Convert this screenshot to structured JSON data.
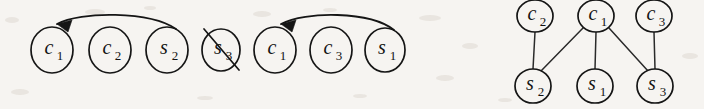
{
  "figure": {
    "background_color": "#f6f4f1",
    "ink_color": "#151515",
    "panels": [
      {
        "id": "sequence-panel",
        "name": "clause-variable-sequence",
        "description": "Linear sequence of labelled nodes with two backward arcs and one crossed-out node"
      },
      {
        "id": "graph-panel",
        "name": "bipartite-incidence-graph",
        "description": "Two-row bipartite graph of clause nodes over variable nodes"
      }
    ]
  },
  "sequence": {
    "nodes": [
      {
        "key": "seq-0",
        "base": "c",
        "sub": "1",
        "label": "c1",
        "cx": 52,
        "cy": 50,
        "rx": 21,
        "ry": 23,
        "crossed": false
      },
      {
        "key": "seq-1",
        "base": "c",
        "sub": "2",
        "label": "c2",
        "cx": 110,
        "cy": 50,
        "rx": 21,
        "ry": 23,
        "crossed": false
      },
      {
        "key": "seq-2",
        "base": "s",
        "sub": "2",
        "label": "s2",
        "cx": 167,
        "cy": 50,
        "rx": 21,
        "ry": 23,
        "crossed": false
      },
      {
        "key": "seq-3",
        "base": "s",
        "sub": "3",
        "label": "s3",
        "cx": 221,
        "cy": 50,
        "rx": 19,
        "ry": 21,
        "crossed": true
      },
      {
        "key": "seq-4",
        "base": "c",
        "sub": "1",
        "label": "c1",
        "cx": 275,
        "cy": 50,
        "rx": 21,
        "ry": 23,
        "crossed": false
      },
      {
        "key": "seq-5",
        "base": "c",
        "sub": "3",
        "label": "c3",
        "cx": 331,
        "cy": 50,
        "rx": 21,
        "ry": 23,
        "crossed": false
      },
      {
        "key": "seq-6",
        "base": "s",
        "sub": "1",
        "label": "s1",
        "cx": 385,
        "cy": 50,
        "rx": 20,
        "ry": 22,
        "crossed": false
      }
    ],
    "strike": {
      "x1": 204,
      "y1": 29,
      "x2": 239,
      "y2": 70
    },
    "arcs": [
      {
        "key": "arc-0",
        "name": "backward-arc-s2-to-c1",
        "from": "seq-2",
        "to": "seq-0",
        "path": "M 176 29 C 150 11, 80 11, 57 24",
        "head": "57,24 72,20 68,32",
        "head_rotation": -28
      },
      {
        "key": "arc-1",
        "name": "backward-arc-s1-to-c1",
        "from": "seq-6",
        "to": "seq-4",
        "path": "M 394 30 C 370 11, 305 11, 281 24",
        "head": "281,24 296,20 292,32",
        "head_rotation": -28
      }
    ]
  },
  "graph": {
    "top_nodes": [
      {
        "key": "g-c2",
        "base": "c",
        "sub": "2",
        "label": "c2",
        "cx": 535,
        "cy": 16,
        "rx": 18,
        "ry": 16
      },
      {
        "key": "g-c1",
        "base": "c",
        "sub": "1",
        "label": "c1",
        "cx": 596,
        "cy": 16,
        "rx": 18,
        "ry": 16
      },
      {
        "key": "g-c3",
        "base": "c",
        "sub": "3",
        "label": "c3",
        "cx": 654,
        "cy": 16,
        "rx": 18,
        "ry": 16
      }
    ],
    "bottom_nodes": [
      {
        "key": "g-s2",
        "base": "s",
        "sub": "2",
        "label": "s2",
        "cx": 533,
        "cy": 86,
        "rx": 18,
        "ry": 17
      },
      {
        "key": "g-s1",
        "base": "s",
        "sub": "1",
        "label": "s1",
        "cx": 595,
        "cy": 86,
        "rx": 18,
        "ry": 17
      },
      {
        "key": "g-s3",
        "base": "s",
        "sub": "3",
        "label": "s3",
        "cx": 655,
        "cy": 86,
        "rx": 18,
        "ry": 17
      }
    ],
    "edges": [
      {
        "key": "e-c2-s2",
        "name": "edge-c2-s2",
        "from": "g-c2",
        "to": "g-s2",
        "x1": 535,
        "y1": 32,
        "x2": 533,
        "y2": 69
      },
      {
        "key": "e-c1-s2",
        "name": "edge-c1-s2",
        "from": "g-c1",
        "to": "g-s2",
        "x1": 583,
        "y1": 28,
        "x2": 541,
        "y2": 71
      },
      {
        "key": "e-c1-s1",
        "name": "edge-c1-s1",
        "from": "g-c1",
        "to": "g-s1",
        "x1": 596,
        "y1": 32,
        "x2": 595,
        "y2": 69
      },
      {
        "key": "e-c1-s3",
        "name": "edge-c1-s3",
        "from": "g-c1",
        "to": "g-s3",
        "x1": 609,
        "y1": 28,
        "x2": 648,
        "y2": 71
      },
      {
        "key": "e-c3-s3",
        "name": "edge-c3-s3",
        "from": "g-c3",
        "to": "g-s3",
        "x1": 654,
        "y1": 32,
        "x2": 655,
        "y2": 69
      }
    ]
  },
  "artifacts": [
    {
      "cx": 12,
      "cy": 20,
      "rx": 7,
      "ry": 3
    },
    {
      "cx": 95,
      "cy": 12,
      "rx": 10,
      "ry": 3
    },
    {
      "cx": 150,
      "cy": 8,
      "rx": 6,
      "ry": 2
    },
    {
      "cx": 262,
      "cy": 14,
      "rx": 9,
      "ry": 3
    },
    {
      "cx": 330,
      "cy": 10,
      "rx": 7,
      "ry": 2
    },
    {
      "cx": 430,
      "cy": 18,
      "rx": 11,
      "ry": 3
    },
    {
      "cx": 470,
      "cy": 46,
      "rx": 8,
      "ry": 3
    },
    {
      "cx": 445,
      "cy": 78,
      "rx": 9,
      "ry": 3
    },
    {
      "cx": 505,
      "cy": 100,
      "rx": 7,
      "ry": 2
    },
    {
      "cx": 690,
      "cy": 56,
      "rx": 8,
      "ry": 3
    },
    {
      "cx": 20,
      "cy": 92,
      "rx": 9,
      "ry": 3
    },
    {
      "cx": 205,
      "cy": 98,
      "rx": 8,
      "ry": 2
    },
    {
      "cx": 360,
      "cy": 96,
      "rx": 7,
      "ry": 2
    }
  ]
}
